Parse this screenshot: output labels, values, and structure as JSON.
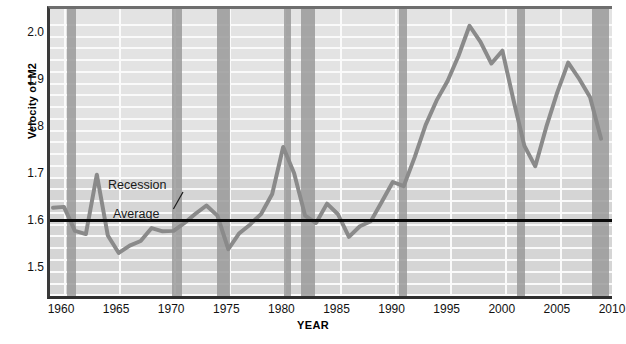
{
  "chart_data": {
    "type": "line",
    "title": "",
    "xlabel": "YEAR",
    "ylabel": "Velocity of M2",
    "xlim": [
      1959,
      2010
    ],
    "ylim": [
      1.44,
      2.05
    ],
    "yticks": [
      "1.5",
      "1.6",
      "1.7",
      "1.8",
      "1.9",
      "2.0"
    ],
    "ytick_values": [
      1.5,
      1.6,
      1.7,
      1.8,
      1.9,
      2.0
    ],
    "xticks": [
      "1960",
      "1965",
      "1970",
      "1975",
      "1980",
      "1985",
      "1990",
      "1995",
      "2000",
      "2005",
      "2010"
    ],
    "xtick_values": [
      1960,
      1965,
      1970,
      1975,
      1980,
      1985,
      1990,
      1995,
      2000,
      2005,
      2010
    ],
    "grid": true,
    "legend": "none",
    "series": [
      {
        "name": "Velocity of M2",
        "color": "#8a8a8a",
        "x": [
          1959,
          1960,
          1961,
          1962,
          1963,
          1964,
          1965,
          1966,
          1967,
          1968,
          1969,
          1970,
          1971,
          1972,
          1973,
          1974,
          1975,
          1976,
          1977,
          1978,
          1979,
          1980,
          1981,
          1982,
          1983,
          1984,
          1985,
          1986,
          1987,
          1988,
          1989,
          1990,
          1991,
          1992,
          1993,
          1994,
          1995,
          1996,
          1997,
          1998,
          1999,
          2000,
          2001,
          2002,
          2003,
          2004,
          2005,
          2006,
          2007,
          2008,
          2009
        ],
        "y": [
          1.625,
          1.627,
          1.575,
          1.568,
          1.697,
          1.565,
          1.527,
          1.543,
          1.553,
          1.581,
          1.574,
          1.575,
          1.592,
          1.612,
          1.63,
          1.608,
          1.535,
          1.57,
          1.589,
          1.612,
          1.655,
          1.757,
          1.7,
          1.608,
          1.592,
          1.634,
          1.611,
          1.562,
          1.585,
          1.596,
          1.638,
          1.681,
          1.672,
          1.735,
          1.805,
          1.858,
          1.9,
          1.955,
          2.02,
          1.985,
          1.938,
          1.966,
          1.86,
          1.76,
          1.715,
          1.8,
          1.875,
          1.94,
          1.905,
          1.865,
          1.775
        ]
      }
    ],
    "average_line": {
      "label": "Average",
      "value": 1.608,
      "color": "#0a0a0a"
    },
    "annotations": [
      {
        "name": "recession-annotation",
        "label": "Recession",
        "x": 1964.5,
        "y": 1.665
      },
      {
        "name": "average-annotation",
        "label": "Average",
        "x": 1965.0,
        "y": 1.625
      }
    ],
    "recession_bands": [
      {
        "name": "recession-1960-1961",
        "start": 1960.3,
        "end": 1961.1
      },
      {
        "name": "recession-1969-1970",
        "start": 1969.8,
        "end": 1970.7
      },
      {
        "name": "recession-1973-1975",
        "start": 1973.9,
        "end": 1975.1
      },
      {
        "name": "recession-1980",
        "start": 1980.0,
        "end": 1980.6
      },
      {
        "name": "recession-1981-1982",
        "start": 1981.5,
        "end": 1982.8
      },
      {
        "name": "recession-1990-1991",
        "start": 1990.4,
        "end": 1991.1
      },
      {
        "name": "recession-2001",
        "start": 2001.1,
        "end": 2001.8
      },
      {
        "name": "recession-2007-2009",
        "start": 2007.9,
        "end": 2009.5
      }
    ],
    "band_color": "#9a9a9a",
    "plot_background": "#d5d5d5",
    "gridline_color": "#fafafa"
  }
}
